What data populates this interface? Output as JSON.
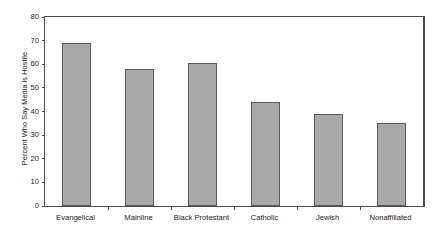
{
  "chart_data": {
    "type": "bar",
    "title": "",
    "xlabel": "",
    "ylabel": "Percent Who Say Media is Hostile",
    "categories": [
      "Evangelical",
      "Mainline",
      "Black Protestant",
      "Catholic",
      "Jewish",
      "Nonaffiliated"
    ],
    "values": [
      69,
      58,
      60.5,
      44,
      39,
      35
    ],
    "ylim": [
      0,
      80
    ],
    "yticks": [
      0,
      10,
      20,
      30,
      40,
      50,
      60,
      70,
      80
    ],
    "ytick_labels": [
      "0",
      "10",
      "20",
      "30",
      "40",
      "50",
      "60",
      "70",
      "80"
    ],
    "grid": false,
    "legend": false,
    "bar_color": "#a9a9a9",
    "bar_edge_color": "#5a5a5a",
    "axis_color": "#4a4a4a",
    "background": "#ffffff"
  },
  "caption": {
    "text": ""
  }
}
